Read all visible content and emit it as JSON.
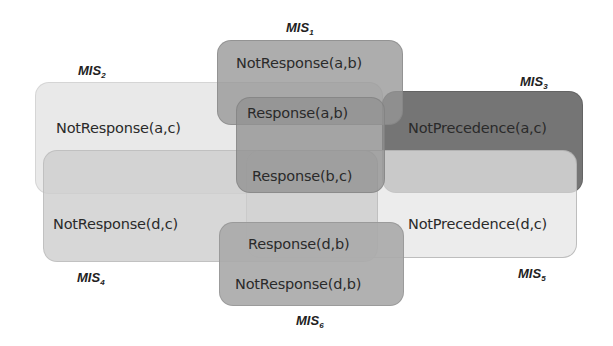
{
  "diagram": {
    "sets": [
      {
        "id": "MIS1",
        "name": "MIS",
        "index": "1",
        "constraints": [
          "NotResponse(a,b)",
          "Response(a,b)"
        ]
      },
      {
        "id": "MIS2",
        "name": "MIS",
        "index": "2",
        "constraints": [
          "NotResponse(a,c)",
          "Response(a,b)",
          "Response(b,c)"
        ]
      },
      {
        "id": "MIS3",
        "name": "MIS",
        "index": "3",
        "constraints": [
          "NotPrecedence(a,c)",
          "Response(a,b)",
          "Response(b,c)"
        ]
      },
      {
        "id": "MIS4",
        "name": "MIS",
        "index": "4",
        "constraints": [
          "NotResponse(d,c)",
          "Response(d,b)",
          "Response(b,c)"
        ]
      },
      {
        "id": "MIS5",
        "name": "MIS",
        "index": "5",
        "constraints": [
          "NotPrecedence(d,c)",
          "Response(d,b)",
          "Response(b,c)"
        ]
      },
      {
        "id": "MIS6",
        "name": "MIS",
        "index": "6",
        "constraints": [
          "Response(d,b)",
          "NotResponse(d,b)"
        ]
      }
    ],
    "labels": {
      "not_response_ab": "NotResponse(a,b)",
      "response_ab": "Response(a,b)",
      "not_response_ac": "NotResponse(a,c)",
      "not_precedence_ac": "NotPrecedence(a,c)",
      "response_bc": "Response(b,c)",
      "not_response_dc": "NotResponse(d,c)",
      "not_precedence_dc": "NotPrecedence(d,c)",
      "response_db": "Response(d,b)",
      "not_response_db": "NotResponse(d,b)"
    },
    "mis_labels": {
      "mis1": {
        "base": "MIS",
        "sub": "1"
      },
      "mis2": {
        "base": "MIS",
        "sub": "2"
      },
      "mis3": {
        "base": "MIS",
        "sub": "3"
      },
      "mis4": {
        "base": "MIS",
        "sub": "4"
      },
      "mis5": {
        "base": "MIS",
        "sub": "5"
      },
      "mis6": {
        "base": "MIS",
        "sub": "6"
      }
    }
  }
}
